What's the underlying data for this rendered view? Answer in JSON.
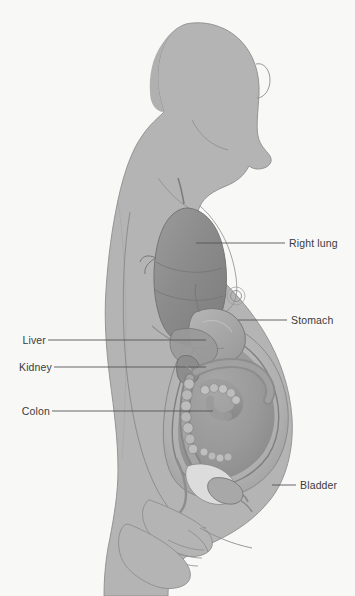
{
  "figure": {
    "background_color": "#f8f8f7",
    "body_color": "#b4b4b4",
    "body_outline_color": "#8d8d8d",
    "organ_dark": "#8f8f8f",
    "organ_mid": "#a5a5a5",
    "organ_light": "#c4c4c4",
    "leader_line_color": "#555555",
    "label_text_color": "#3b3b3b"
  },
  "labels": {
    "right_lung": "Right lung",
    "stomach": "Stomach",
    "liver": "Liver",
    "kidney": "Kidney",
    "colon": "Colon",
    "bladder": "Bladder"
  },
  "callouts": [
    {
      "id": "right-lung",
      "text": "Right lung",
      "side": "right",
      "line": {
        "x1": 196,
        "y1": 243,
        "x2": 285,
        "y2": 243
      }
    },
    {
      "id": "stomach",
      "text": "Stomach",
      "side": "right",
      "line": {
        "x1": 238,
        "y1": 320,
        "x2": 287,
        "y2": 320
      }
    },
    {
      "id": "bladder",
      "text": "Bladder",
      "side": "right",
      "line": {
        "x1": 272,
        "y1": 485,
        "x2": 296,
        "y2": 485
      }
    },
    {
      "id": "liver",
      "text": "Liver",
      "side": "left",
      "line": {
        "x1": 48,
        "y1": 340,
        "x2": 206,
        "y2": 340
      }
    },
    {
      "id": "kidney",
      "text": "Kidney",
      "side": "left",
      "line": {
        "x1": 54,
        "y1": 367,
        "x2": 206,
        "y2": 367
      }
    },
    {
      "id": "colon",
      "text": "Colon",
      "side": "left",
      "line": {
        "x1": 52,
        "y1": 411,
        "x2": 213,
        "y2": 411
      }
    }
  ]
}
